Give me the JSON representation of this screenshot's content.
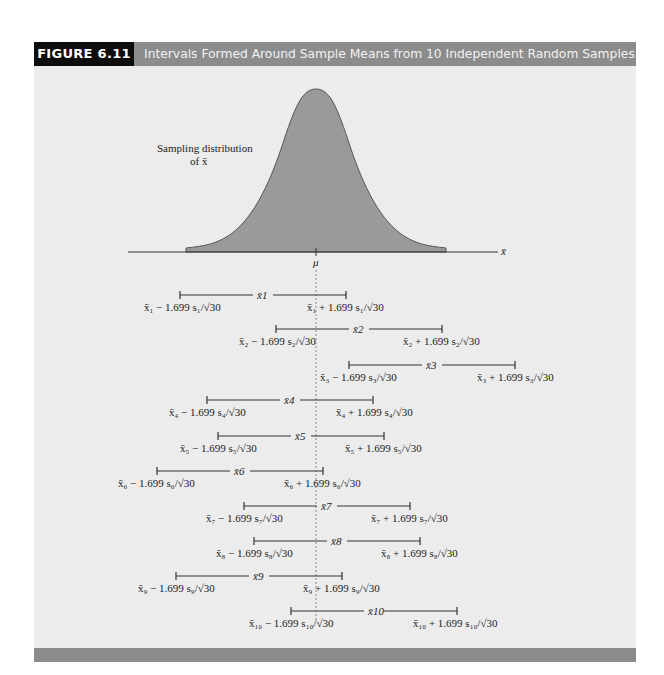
{
  "figure": {
    "number": "FIGURE 6.11",
    "title": "Intervals Formed Around Sample Means from 10 Independent Random Samples"
  },
  "distribution": {
    "label_line1": "Sampling distribution",
    "label_line2": "of x̄",
    "axis_label": "x̄",
    "mean_label": "μ"
  },
  "colors": {
    "header_bg": "#8c8c8c",
    "figure_number_bg": "#0d0d0d",
    "panel_bg": "#ececec",
    "curve_fill": "#9a9a9a",
    "line": "#333333"
  },
  "chart_data": {
    "type": "interval",
    "title": "Intervals Formed Around Sample Means from 10 Independent Random Samples",
    "xlabel": "x̄",
    "mean": "μ",
    "critical_value": 1.699,
    "sample_size": 30,
    "intervals": [
      {
        "sample": 1,
        "lower_px": 180,
        "center_px": 263,
        "upper_px": 346,
        "contains_mu": true
      },
      {
        "sample": 2,
        "lower_px": 276,
        "center_px": 359,
        "upper_px": 442,
        "contains_mu": true
      },
      {
        "sample": 3,
        "lower_px": 349,
        "center_px": 432,
        "upper_px": 515,
        "contains_mu": false
      },
      {
        "sample": 4,
        "lower_px": 207,
        "center_px": 290,
        "upper_px": 373,
        "contains_mu": true
      },
      {
        "sample": 5,
        "lower_px": 218,
        "center_px": 301,
        "upper_px": 384,
        "contains_mu": true
      },
      {
        "sample": 6,
        "lower_px": 157,
        "center_px": 240,
        "upper_px": 323,
        "contains_mu": true
      },
      {
        "sample": 7,
        "lower_px": 244,
        "center_px": 327,
        "upper_px": 410,
        "contains_mu": true
      },
      {
        "sample": 8,
        "lower_px": 254,
        "center_px": 337,
        "upper_px": 420,
        "contains_mu": true
      },
      {
        "sample": 9,
        "lower_px": 176,
        "center_px": 259,
        "upper_px": 342,
        "contains_mu": true
      },
      {
        "sample": 10,
        "lower_px": 291,
        "center_px": 374,
        "upper_px": 457,
        "contains_mu": true
      }
    ],
    "mu_px": 316
  },
  "intervals": [
    {
      "center": "x̄1",
      "lower": "x̄₁ − 1.699 s₁/√30",
      "upper": "x̄₁ + 1.699 s₁/√30"
    },
    {
      "center": "x̄2",
      "lower": "x̄₂ − 1.699 s₂/√30",
      "upper": "x̄₂ + 1.699 s₂/√30"
    },
    {
      "center": "x̄3",
      "lower": "x̄₃ − 1.699 s₃/√30",
      "upper": "x̄₃ + 1.699 s₃/√30"
    },
    {
      "center": "x̄4",
      "lower": "x̄₄ − 1.699 s₄/√30",
      "upper": "x̄₄ + 1.699 s₄/√30"
    },
    {
      "center": "x̄5",
      "lower": "x̄₅ − 1.699 s₅/√30",
      "upper": "x̄₅ + 1.699 s₅/√30"
    },
    {
      "center": "x̄6",
      "lower": "x̄₆ − 1.699 s₆/√30",
      "upper": "x̄₆ + 1.699 s₆/√30"
    },
    {
      "center": "x̄7",
      "lower": "x̄₇ − 1.699 s₇/√30",
      "upper": "x̄₇ + 1.699 s₇/√30"
    },
    {
      "center": "x̄8",
      "lower": "x̄₈ − 1.699 s₈/√30",
      "upper": "x̄₈ + 1.699 s₈/√30"
    },
    {
      "center": "x̄9",
      "lower": "x̄₉ − 1.699 s₉/√30",
      "upper": "x̄₉ + 1.699 s₉/√30"
    },
    {
      "center": "x̄10",
      "lower": "x̄₁₀ − 1.699 s₁₀/√30",
      "upper": "x̄₁₀ + 1.699 s₁₀/√30"
    }
  ]
}
